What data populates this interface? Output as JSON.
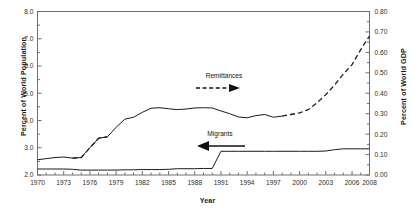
{
  "chart_data": {
    "type": "line",
    "title": "",
    "xlabel": "Year",
    "ylabel": "Percent of World Population",
    "ylabel_right": "Percent of World GDP",
    "grid": false,
    "legend": "annotations-with-arrows",
    "xlim": [
      1970,
      2008
    ],
    "xticks_labeled": [
      "1970",
      "1973",
      "1976",
      "1979",
      "1982",
      "1985",
      "1988",
      "1991",
      "1994",
      "1997",
      "2000",
      "2003",
      "2006",
      "2008"
    ],
    "xtick_interval_minor": 1,
    "ylim_left": [
      2.0,
      8.0
    ],
    "yticks_left": [
      "2.0",
      "3.0",
      "4.0",
      "5.0",
      "6.0",
      "7.0",
      "8.0"
    ],
    "ylim_right": [
      0.0,
      0.8
    ],
    "yticks_right": [
      "0.00",
      "0.10",
      "0.20",
      "0.30",
      "0.40",
      "0.50",
      "0.60",
      "0.70",
      "0.80"
    ],
    "annotations": [
      {
        "text": "Remittances",
        "arrow": "right",
        "style": "dashed",
        "x": 1992.5,
        "y_axis": "right",
        "y": 0.45
      },
      {
        "text": "Migrants",
        "arrow": "left",
        "style": "solid",
        "x": 1993.0,
        "y_axis": "left",
        "y": 3.05
      }
    ],
    "series": [
      {
        "name": "Remittances",
        "axis": "right",
        "unit": "Percent of World GDP",
        "linestyle": "dashed",
        "color": "#1a1a1a",
        "x": [
          1970,
          1971,
          1972,
          1973,
          1974,
          1975,
          1976,
          1977,
          1978,
          1979,
          1980,
          1981,
          1982,
          1983,
          1984,
          1985,
          1986,
          1987,
          1988,
          1989,
          1990,
          1991,
          1992,
          1993,
          1994,
          1995,
          1996,
          1997,
          1998,
          1999,
          2000,
          2001,
          2002,
          2003,
          2004,
          2005,
          2006,
          2007,
          2008
        ],
        "values": [
          0.088,
          0.091,
          0.095,
          0.098,
          0.113,
          0.135,
          0.152,
          0.168,
          0.191,
          0.214,
          0.24,
          0.248,
          0.245,
          0.236,
          0.235,
          0.243,
          0.247,
          0.245,
          0.24,
          0.233,
          0.238,
          0.228,
          0.233,
          0.228,
          0.235,
          0.239,
          0.241,
          0.248,
          0.252,
          0.263,
          0.3,
          0.33,
          0.37,
          0.42,
          0.47,
          0.52,
          0.57,
          0.65,
          0.715
        ]
      },
      {
        "name": "Migrants",
        "axis": "left",
        "unit": "Percent of World Population",
        "linestyle": "solid",
        "color": "#1a1a1a",
        "x": [
          1970,
          1971,
          1972,
          1973,
          1974,
          1975,
          1976,
          1977,
          1978,
          1979,
          1980,
          1981,
          1982,
          1983,
          1984,
          1985,
          1986,
          1987,
          1988,
          1989,
          1990,
          1991,
          1992,
          1993,
          1994,
          1995,
          1996,
          1997,
          1998,
          1999,
          2000,
          2001,
          2002,
          2003,
          2004,
          2005,
          2006,
          2007,
          2008
        ],
        "values": [
          2.22,
          2.22,
          2.22,
          2.22,
          2.21,
          2.18,
          2.18,
          2.18,
          2.18,
          2.18,
          2.19,
          2.19,
          2.2,
          2.2,
          2.2,
          2.21,
          2.23,
          2.23,
          2.23,
          2.24,
          2.24,
          2.87,
          2.87,
          2.87,
          2.87,
          2.87,
          2.87,
          2.87,
          2.87,
          2.87,
          2.87,
          2.87,
          2.87,
          2.88,
          2.93,
          2.96,
          2.96,
          2.96,
          2.96
        ]
      },
      {
        "name": "Remittances (left-axis trace)",
        "axis": "left",
        "unit": "Percent of World Population",
        "linestyle": "solid-to-dashed",
        "color": "#1a1a1a",
        "x": [
          1970,
          1971,
          1972,
          1973,
          1974,
          1975,
          1976,
          1977,
          1978,
          1979,
          1980,
          1981,
          1982,
          1983,
          1984,
          1985,
          1986,
          1987,
          1988,
          1989,
          1990,
          1991,
          1992,
          1993,
          1994,
          1995,
          1996,
          1997,
          1998,
          1999,
          2000,
          2001,
          2002,
          2003,
          2004,
          2005,
          2006,
          2007,
          2008
        ],
        "values": [
          2.56,
          2.6,
          2.64,
          2.66,
          2.62,
          2.64,
          3.0,
          3.35,
          3.4,
          3.75,
          4.05,
          4.12,
          4.3,
          4.45,
          4.47,
          4.43,
          4.4,
          4.42,
          4.46,
          4.47,
          4.46,
          4.35,
          4.25,
          4.13,
          4.1,
          4.18,
          4.22,
          4.12,
          4.16,
          4.22,
          4.28,
          4.4,
          4.65,
          4.95,
          5.3,
          5.7,
          6.05,
          6.6,
          7.1
        ]
      }
    ]
  },
  "axes": {
    "left_title": "Percent of World Population",
    "right_title": "Percent of World GDP",
    "x_title": "Year"
  },
  "annotation_labels": {
    "remittances": "Remittances",
    "migrants": "Migrants"
  }
}
